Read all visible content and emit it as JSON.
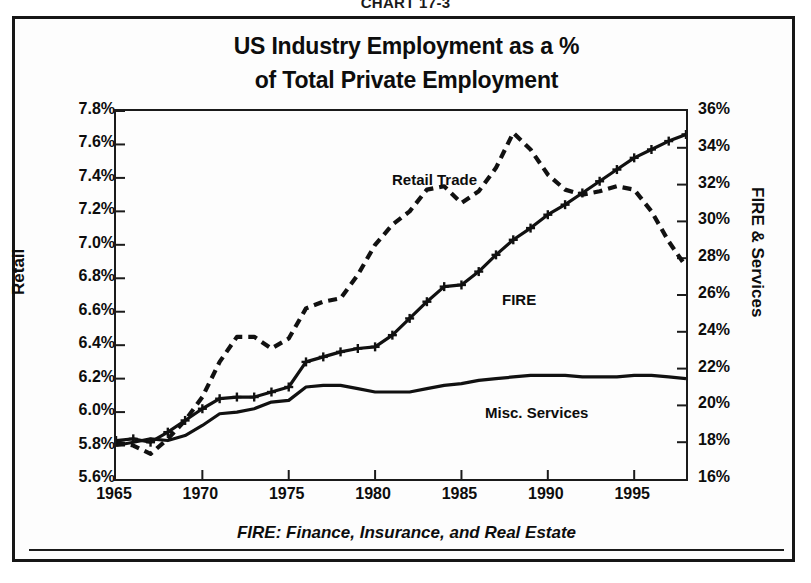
{
  "chart_number": "CHART 17-3",
  "title": {
    "line1": "US Industry Employment as a %",
    "line2": "of Total Private Employment"
  },
  "footnote": "FIRE:  Finance, Insurance, and Real Estate",
  "axes": {
    "left_label": "Retail",
    "right_label": "FIRE & Services",
    "left_ticks": [
      "5.6%",
      "5.8%",
      "6.0%",
      "6.2%",
      "6.4%",
      "6.6%",
      "6.8%",
      "7.0%",
      "7.2%",
      "7.4%",
      "7.6%",
      "7.8%"
    ],
    "right_ticks": [
      "16%",
      "18%",
      "20%",
      "22%",
      "24%",
      "26%",
      "28%",
      "30%",
      "32%",
      "34%",
      "36%"
    ],
    "x_ticks": [
      "1965",
      "1970",
      "1975",
      "1980",
      "1985",
      "1990",
      "1995"
    ]
  },
  "annotations": {
    "retail_trade": "Retail Trade",
    "fire": "FIRE",
    "misc_services": "Misc.  Services"
  },
  "colors": {
    "ink": "#111111",
    "frame": "#1b1b1b",
    "background": "#ffffff"
  },
  "chart_data": {
    "type": "line",
    "title": "US Industry Employment as a % of Total Private Employment",
    "subtitle": "CHART 17-3",
    "xlabel": "",
    "ylabel": "Retail",
    "y2label": "FIRE & Services",
    "xlim": [
      1965,
      1998
    ],
    "ylim": [
      5.6,
      7.8
    ],
    "y2lim": [
      16,
      36
    ],
    "grid": false,
    "legend": "inline-annotations",
    "note": "Retail Trade read on left axis (%), FIRE and Misc. Services read on right axis (%). Left axis 5.6-7.8% maps to right axis 16-36%.",
    "x": [
      1965,
      1966,
      1967,
      1968,
      1969,
      1970,
      1971,
      1972,
      1973,
      1974,
      1975,
      1976,
      1977,
      1978,
      1979,
      1980,
      1981,
      1982,
      1983,
      1984,
      1985,
      1986,
      1987,
      1988,
      1989,
      1990,
      1991,
      1992,
      1993,
      1994,
      1995,
      1996,
      1997,
      1998
    ],
    "series": [
      {
        "name": "Retail Trade",
        "axis": "left",
        "unit": "%",
        "style": "dashed",
        "marker": "none",
        "values": [
          5.82,
          5.8,
          5.75,
          5.84,
          5.95,
          6.09,
          6.3,
          6.45,
          6.45,
          6.38,
          6.44,
          6.62,
          6.66,
          6.68,
          6.82,
          7.0,
          7.12,
          7.2,
          7.33,
          7.35,
          7.25,
          7.32,
          7.46,
          7.67,
          7.57,
          7.42,
          7.33,
          7.3,
          7.32,
          7.35,
          7.33,
          7.2,
          7.02,
          6.87
        ]
      },
      {
        "name": "FIRE",
        "axis": "right",
        "unit": "%",
        "style": "solid",
        "marker": "plus",
        "values_left_scale": [
          5.83,
          5.84,
          5.82,
          5.88,
          5.95,
          6.02,
          6.08,
          6.09,
          6.09,
          6.12,
          6.15,
          6.3,
          6.33,
          6.36,
          6.38,
          6.39,
          6.46,
          6.56,
          6.66,
          6.75,
          6.76,
          6.84,
          6.94,
          7.03,
          7.1,
          7.18,
          7.24,
          7.31,
          7.38,
          7.45,
          7.52,
          7.57,
          7.62,
          7.66
        ],
        "values": [
          17.9,
          18.0,
          17.8,
          18.4,
          19.0,
          19.6,
          20.1,
          20.2,
          20.2,
          20.5,
          20.7,
          22.1,
          22.4,
          22.6,
          22.8,
          22.9,
          23.5,
          24.4,
          25.3,
          26.1,
          26.2,
          26.9,
          27.8,
          28.6,
          29.3,
          30.0,
          30.6,
          31.2,
          31.8,
          32.5,
          33.1,
          33.5,
          34.0,
          34.4
        ]
      },
      {
        "name": "Misc. Services",
        "axis": "right",
        "unit": "%",
        "style": "solid",
        "marker": "none",
        "values_left_scale": [
          5.8,
          5.82,
          5.84,
          5.83,
          5.86,
          5.92,
          5.99,
          6.0,
          6.02,
          6.06,
          6.07,
          6.15,
          6.16,
          6.16,
          6.14,
          6.12,
          6.12,
          6.12,
          6.14,
          6.16,
          6.17,
          6.19,
          6.2,
          6.21,
          6.22,
          6.22,
          6.22,
          6.21,
          6.21,
          6.21,
          6.22,
          6.22,
          6.21,
          6.2
        ],
        "values": [
          17.6,
          17.8,
          18.0,
          17.9,
          18.2,
          18.7,
          19.3,
          19.4,
          19.6,
          20.0,
          20.1,
          20.8,
          20.9,
          20.9,
          20.7,
          20.6,
          20.6,
          20.6,
          20.8,
          20.9,
          21.0,
          21.2,
          21.3,
          21.4,
          21.5,
          21.5,
          21.5,
          21.4,
          21.4,
          21.4,
          21.5,
          21.5,
          21.4,
          21.3
        ]
      }
    ]
  }
}
